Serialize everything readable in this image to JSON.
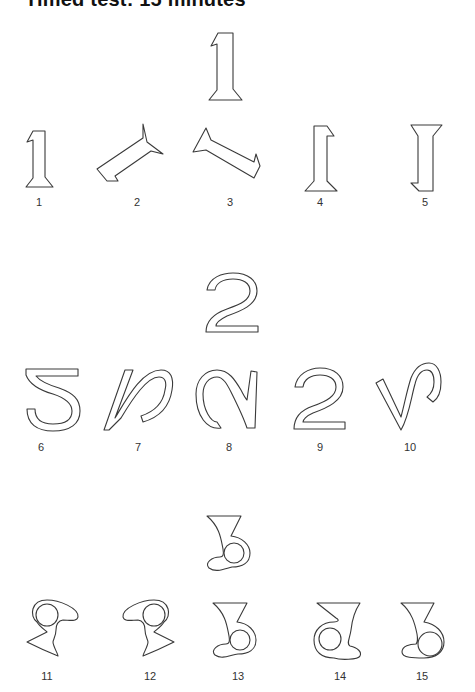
{
  "title": "Timed test: 15 minutes",
  "groups": [
    {
      "reference_digit": "1",
      "options": [
        {
          "label": "1",
          "transform": "rotated slightly / similar"
        },
        {
          "label": "2",
          "transform": "rotated ~45°"
        },
        {
          "label": "3",
          "transform": "rotated ~-60°"
        },
        {
          "label": "4",
          "transform": "mirrored"
        },
        {
          "label": "5",
          "transform": "upside down"
        }
      ]
    },
    {
      "reference_digit": "2",
      "options": [
        {
          "label": "6",
          "transform": "flipped vertically"
        },
        {
          "label": "7",
          "transform": "slanted/rotated"
        },
        {
          "label": "8",
          "transform": "rotated"
        },
        {
          "label": "9",
          "transform": "same"
        },
        {
          "label": "10",
          "transform": "rotated"
        }
      ]
    },
    {
      "reference_digit": "3",
      "options": [
        {
          "label": "11",
          "transform": "rotated"
        },
        {
          "label": "12",
          "transform": "rotated/mirrored"
        },
        {
          "label": "13",
          "transform": "same"
        },
        {
          "label": "14",
          "transform": "mirrored"
        },
        {
          "label": "15",
          "transform": "variant"
        }
      ]
    }
  ],
  "labels": [
    "1",
    "2",
    "3",
    "4",
    "5",
    "6",
    "7",
    "8",
    "9",
    "10",
    "11",
    "12",
    "13",
    "14",
    "15"
  ]
}
